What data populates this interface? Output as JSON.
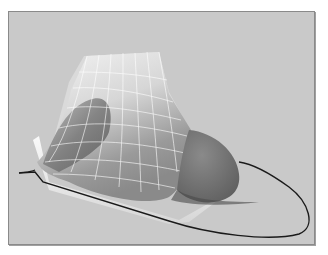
{
  "figure": {
    "colors": {
      "background": "#c9c9c9",
      "frame_border": "#8a8a8a",
      "surface_light": "#f2f2f2",
      "surface_dark": "#6e6e6e",
      "cap_dark": "#737373",
      "wire": "#ffffff",
      "curve": "#1a1a1a"
    },
    "elements": [
      {
        "name": "wireframe-surface",
        "label": "Wireframe surface"
      },
      {
        "name": "dark-cap",
        "label": "Shaded end cap"
      },
      {
        "name": "base-curve",
        "label": "Elliptical base curve"
      },
      {
        "name": "base-plate",
        "label": "Base plate"
      }
    ]
  }
}
